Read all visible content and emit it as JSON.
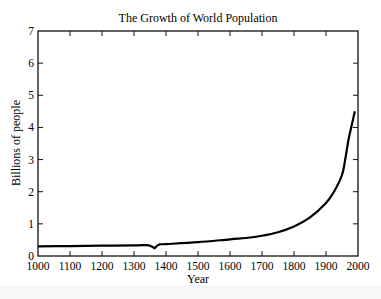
{
  "chart_data": {
    "type": "line",
    "title": "The Growth of World Population",
    "xlabel": "Year",
    "ylabel": "Billions of people",
    "xlim": [
      1000,
      2000
    ],
    "ylim": [
      0,
      7
    ],
    "xticks": [
      1000,
      1100,
      1200,
      1300,
      1400,
      1500,
      1600,
      1700,
      1800,
      1900,
      2000
    ],
    "yticks": [
      0,
      1,
      2,
      3,
      4,
      5,
      6,
      7
    ],
    "grid": false,
    "legend": null,
    "series": [
      {
        "name": "World population",
        "color": "#000000",
        "x": [
          1000,
          1100,
          1200,
          1300,
          1340,
          1350,
          1360,
          1365,
          1370,
          1380,
          1400,
          1500,
          1600,
          1650,
          1700,
          1750,
          1800,
          1850,
          1900,
          1925,
          1950,
          1960,
          1970,
          1980,
          1990
        ],
        "y": [
          0.3,
          0.31,
          0.32,
          0.33,
          0.34,
          0.32,
          0.27,
          0.24,
          0.3,
          0.36,
          0.37,
          0.43,
          0.52,
          0.56,
          0.63,
          0.74,
          0.92,
          1.2,
          1.65,
          2.0,
          2.52,
          3.0,
          3.6,
          4.05,
          4.5
        ]
      }
    ]
  }
}
